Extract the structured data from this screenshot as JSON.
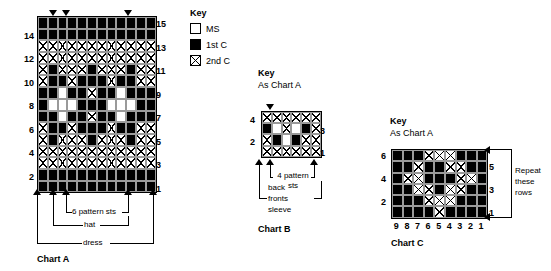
{
  "legend_main": {
    "title": "Key",
    "entries": [
      {
        "swatch": "MS",
        "label": "MS"
      },
      {
        "swatch": "1stC",
        "label": "1st C"
      },
      {
        "swatch": "2ndC",
        "label": "2nd C"
      }
    ]
  },
  "legend_b": {
    "title": "Key",
    "text": "As Chart A"
  },
  "legend_c": {
    "title": "Key",
    "text": "As Chart A"
  },
  "chart_a": {
    "title": "Chart A",
    "rows": 15,
    "cols": 12,
    "left_row_labels": [
      "14",
      "12",
      "10",
      "8",
      "6",
      "4",
      "2"
    ],
    "right_row_labels": [
      "15",
      "13",
      "11",
      "9",
      "7",
      "5",
      "3",
      "1"
    ],
    "brackets": [
      {
        "label": "6 pattern sts"
      },
      {
        "label": "hat"
      },
      {
        "label": "dress"
      }
    ],
    "chart_data": {
      "type": "heatmap",
      "title": "Chart A",
      "xlabel": "",
      "ylabel": "",
      "legend": [
        "MS",
        "1st C",
        "2nd C"
      ],
      "rows_top_to_bottom": [
        {
          "row": 15,
          "cells": [
            "1stC",
            "1stC",
            "1stC",
            "1stC",
            "1stC",
            "1stC",
            "1stC",
            "1stC",
            "1stC",
            "1stC",
            "1stC",
            "1stC"
          ]
        },
        {
          "row": 14,
          "cells": [
            "1stC",
            "1stC",
            "1stC",
            "1stC",
            "1stC",
            "1stC",
            "1stC",
            "1stC",
            "1stC",
            "1stC",
            "1stC",
            "1stC"
          ]
        },
        {
          "row": 13,
          "cells": [
            "2ndC",
            "2ndC",
            "2ndC",
            "2ndC",
            "2ndC",
            "2ndC",
            "2ndC",
            "2ndC",
            "2ndC",
            "2ndC",
            "2ndC",
            "2ndC"
          ]
        },
        {
          "row": 12,
          "cells": [
            "2ndC",
            "2ndC",
            "2ndC",
            "2ndC",
            "2ndC",
            "2ndC",
            "2ndC",
            "2ndC",
            "2ndC",
            "2ndC",
            "2ndC",
            "2ndC"
          ]
        },
        {
          "row": 11,
          "cells": [
            "2ndC",
            "1stC",
            "2ndC",
            "2ndC",
            "2ndC",
            "1stC",
            "2ndC",
            "2ndC",
            "2ndC",
            "1stC",
            "2ndC",
            "2ndC"
          ]
        },
        {
          "row": 10,
          "cells": [
            "2ndC",
            "1stC",
            "1stC",
            "2ndC",
            "1stC",
            "1stC",
            "1stC",
            "2ndC",
            "1stC",
            "1stC",
            "2ndC",
            "2ndC"
          ]
        },
        {
          "row": 9,
          "cells": [
            "1stC",
            "1stC",
            "MS",
            "1stC",
            "1stC",
            "2ndC",
            "1stC",
            "1stC",
            "MS",
            "1stC",
            "1stC",
            "1stC"
          ]
        },
        {
          "row": 8,
          "cells": [
            "1stC",
            "MS",
            "MS",
            "MS",
            "1stC",
            "1stC",
            "1stC",
            "MS",
            "MS",
            "MS",
            "1stC",
            "1stC"
          ]
        },
        {
          "row": 7,
          "cells": [
            "1stC",
            "1stC",
            "MS",
            "1stC",
            "1stC",
            "2ndC",
            "1stC",
            "1stC",
            "MS",
            "1stC",
            "1stC",
            "1stC"
          ]
        },
        {
          "row": 6,
          "cells": [
            "2ndC",
            "1stC",
            "1stC",
            "2ndC",
            "1stC",
            "1stC",
            "1stC",
            "2ndC",
            "1stC",
            "1stC",
            "2ndC",
            "2ndC"
          ]
        },
        {
          "row": 5,
          "cells": [
            "2ndC",
            "1stC",
            "2ndC",
            "2ndC",
            "2ndC",
            "1stC",
            "2ndC",
            "2ndC",
            "2ndC",
            "1stC",
            "2ndC",
            "2ndC"
          ]
        },
        {
          "row": 4,
          "cells": [
            "2ndC",
            "2ndC",
            "2ndC",
            "2ndC",
            "2ndC",
            "2ndC",
            "2ndC",
            "2ndC",
            "2ndC",
            "2ndC",
            "2ndC",
            "2ndC"
          ]
        },
        {
          "row": 3,
          "cells": [
            "2ndC",
            "2ndC",
            "2ndC",
            "2ndC",
            "2ndC",
            "2ndC",
            "2ndC",
            "2ndC",
            "2ndC",
            "2ndC",
            "2ndC",
            "2ndC"
          ]
        },
        {
          "row": 2,
          "cells": [
            "1stC",
            "1stC",
            "1stC",
            "1stC",
            "1stC",
            "1stC",
            "1stC",
            "1stC",
            "1stC",
            "1stC",
            "1stC",
            "1stC"
          ]
        },
        {
          "row": 1,
          "cells": [
            "1stC",
            "1stC",
            "1stC",
            "1stC",
            "1stC",
            "1stC",
            "1stC",
            "1stC",
            "1stC",
            "1stC",
            "1stC",
            "1stC"
          ]
        }
      ]
    }
  },
  "chart_b": {
    "title": "Chart B",
    "rows": 4,
    "cols": 6,
    "left_row_labels": [
      "4",
      "2"
    ],
    "right_row_labels": [
      "3",
      "1"
    ],
    "brackets": [
      {
        "label": "4 pattern sts"
      },
      {
        "label": "back"
      },
      {
        "label": "fronts"
      },
      {
        "label": "sleeve"
      }
    ],
    "chart_data": {
      "type": "heatmap",
      "title": "Chart B",
      "legend": [
        "MS",
        "1st C",
        "2nd C"
      ],
      "rows_top_to_bottom": [
        {
          "row": 4,
          "cells": [
            "2ndC",
            "2ndC",
            "2ndC",
            "2ndC",
            "2ndC",
            "2ndC"
          ]
        },
        {
          "row": 3,
          "cells": [
            "1stC",
            "MS",
            "2ndC",
            "MS",
            "1stC",
            "2ndC"
          ]
        },
        {
          "row": 2,
          "cells": [
            "2ndC",
            "1stC",
            "MS",
            "1stC",
            "2ndC",
            "2ndC"
          ]
        },
        {
          "row": 1,
          "cells": [
            "2ndC",
            "2ndC",
            "2ndC",
            "2ndC",
            "2ndC",
            "2ndC"
          ]
        }
      ]
    }
  },
  "chart_c": {
    "title": "Chart C",
    "rows": 6,
    "cols": 9,
    "left_row_labels": [
      "6",
      "4",
      "2"
    ],
    "right_row_labels": [
      "5",
      "3",
      "1"
    ],
    "col_labels": [
      "9",
      "8",
      "7",
      "6",
      "5",
      "4",
      "3",
      "2",
      "1"
    ],
    "repeat_note": "Repeat\nthese\nrows",
    "repeat_note_lines": [
      "Repeat",
      "these",
      "rows"
    ],
    "chart_data": {
      "type": "heatmap",
      "title": "Chart C",
      "legend": [
        "MS",
        "1st C",
        "2nd C"
      ],
      "rows_top_to_bottom": [
        {
          "row": 6,
          "cells": [
            "1stC",
            "1stC",
            "1stC",
            "2ndC",
            "2ndC",
            "2ndC",
            "1stC",
            "1stC",
            "1stC"
          ]
        },
        {
          "row": 5,
          "cells": [
            "1stC",
            "1stC",
            "2ndC",
            "1stC",
            "1stC",
            "2ndC",
            "2ndC",
            "1stC",
            "1stC"
          ]
        },
        {
          "row": 4,
          "cells": [
            "1stC",
            "2ndC",
            "2ndC",
            "1stC",
            "1stC",
            "1stC",
            "2ndC",
            "2ndC",
            "1stC"
          ]
        },
        {
          "row": 3,
          "cells": [
            "1stC",
            "1stC",
            "2ndC",
            "2ndC",
            "1stC",
            "2ndC",
            "2ndC",
            "1stC",
            "1stC"
          ]
        },
        {
          "row": 2,
          "cells": [
            "1stC",
            "1stC",
            "1stC",
            "2ndC",
            "2ndC",
            "2ndC",
            "1stC",
            "1stC",
            "1stC"
          ]
        },
        {
          "row": 1,
          "cells": [
            "1stC",
            "1stC",
            "1stC",
            "1stC",
            "2ndC",
            "1stC",
            "1stC",
            "1stC",
            "1stC"
          ]
        }
      ]
    }
  }
}
